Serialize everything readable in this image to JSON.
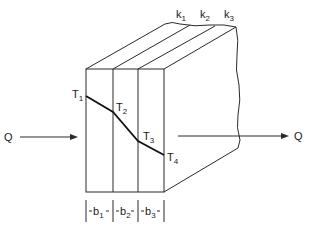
{
  "diagram": {
    "type": "composite-wall-heat-conduction",
    "colors": {
      "line": "#2a2a2a",
      "background": "#ffffff"
    },
    "heat_flow": {
      "in_label": "Q",
      "out_label": "Q"
    },
    "layers": [
      {
        "conductivity": {
          "base": "k",
          "sub": "1"
        },
        "thickness": {
          "base": "b",
          "sub": "1"
        }
      },
      {
        "conductivity": {
          "base": "k",
          "sub": "2"
        },
        "thickness": {
          "base": "b",
          "sub": "2"
        }
      },
      {
        "conductivity": {
          "base": "k",
          "sub": "3"
        },
        "thickness": {
          "base": "b",
          "sub": "3"
        }
      }
    ],
    "temperatures": [
      {
        "base": "T",
        "sub": "1"
      },
      {
        "base": "T",
        "sub": "2"
      },
      {
        "base": "T",
        "sub": "3"
      },
      {
        "base": "T",
        "sub": "4"
      }
    ]
  }
}
